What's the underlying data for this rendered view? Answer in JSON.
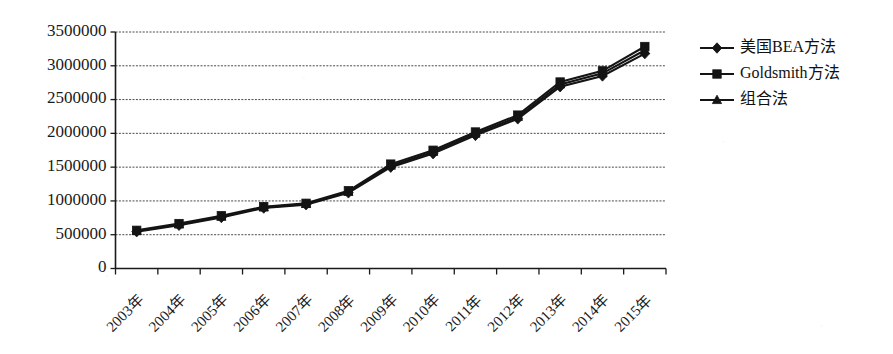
{
  "chart_data": {
    "type": "line",
    "title": "",
    "xlabel": "",
    "ylabel": "",
    "categories": [
      "2003年",
      "2004年",
      "2005年",
      "2006年",
      "2007年",
      "2008年",
      "2009年",
      "2010年",
      "2011年",
      "2012年",
      "2013年",
      "2014年",
      "2015年"
    ],
    "ylim": [
      0,
      3500000
    ],
    "ytick_labels": [
      "3500000",
      "3000000",
      "2500000",
      "2000000",
      "1500000",
      "1000000",
      "500000",
      "0"
    ],
    "yticks": [
      3500000,
      3000000,
      2500000,
      2000000,
      1500000,
      1000000,
      500000,
      0
    ],
    "grid": true,
    "legend_position": "right",
    "series": [
      {
        "name": "美国BEA方法",
        "marker": "diamond",
        "values": [
          545000,
          640000,
          755000,
          895000,
          945000,
          1120000,
          1500000,
          1700000,
          1970000,
          2215000,
          2690000,
          2850000,
          3180000
        ]
      },
      {
        "name": "Goldsmith方法",
        "marker": "square",
        "values": [
          565000,
          665000,
          780000,
          915000,
          965000,
          1150000,
          1545000,
          1750000,
          2020000,
          2270000,
          2760000,
          2925000,
          3285000
        ]
      },
      {
        "name": "组合法",
        "marker": "triangle",
        "values": [
          555000,
          652000,
          767000,
          905000,
          955000,
          1135000,
          1522000,
          1725000,
          1995000,
          2242000,
          2725000,
          2888000,
          3230000
        ]
      }
    ]
  },
  "legend": {
    "items": [
      {
        "label": "美国BEA方法",
        "marker": "diamond-marker"
      },
      {
        "label": "Goldsmith方法",
        "marker": "square-marker"
      },
      {
        "label": "组合法",
        "marker": "triangle-marker"
      }
    ]
  },
  "colors": {
    "ink": "#141414",
    "grid": "#2b2b2b",
    "background": "#ffffff"
  }
}
